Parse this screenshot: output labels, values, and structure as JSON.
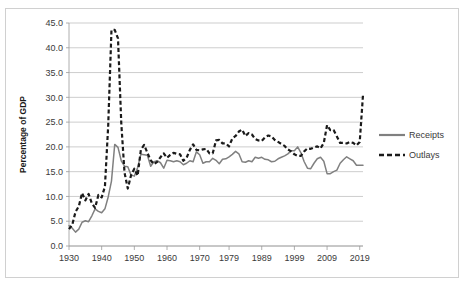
{
  "chart_data": {
    "type": "line",
    "title": "",
    "xlabel": "",
    "ylabel": "Percentage of GDP",
    "ylim": [
      0.0,
      45.0
    ],
    "xlim": [
      1930,
      2020
    ],
    "yticks": [
      "0.0",
      "5.0",
      "10.0",
      "15.0",
      "20.0",
      "25.0",
      "30.0",
      "35.0",
      "40.0",
      "45.0"
    ],
    "ytick_values": [
      0.0,
      5.0,
      10.0,
      15.0,
      20.0,
      25.0,
      30.0,
      35.0,
      40.0,
      45.0
    ],
    "xticks": [
      "1930",
      "1940",
      "1950",
      "1960",
      "1970",
      "1979",
      "1989",
      "1999",
      "2009",
      "2019"
    ],
    "xtick_values": [
      1930,
      1940,
      1950,
      1960,
      1970,
      1979,
      1989,
      1999,
      2009,
      2019
    ],
    "grid": true,
    "legend_position": "right",
    "x": [
      1930,
      1931,
      1932,
      1933,
      1934,
      1935,
      1936,
      1937,
      1938,
      1939,
      1940,
      1941,
      1942,
      1943,
      1944,
      1945,
      1946,
      1947,
      1948,
      1949,
      1950,
      1951,
      1952,
      1953,
      1954,
      1955,
      1956,
      1957,
      1958,
      1959,
      1960,
      1961,
      1962,
      1963,
      1964,
      1965,
      1966,
      1967,
      1968,
      1969,
      1970,
      1971,
      1972,
      1973,
      1974,
      1975,
      1976,
      1977,
      1978,
      1979,
      1980,
      1981,
      1982,
      1983,
      1984,
      1985,
      1986,
      1987,
      1988,
      1989,
      1990,
      1991,
      1992,
      1993,
      1994,
      1995,
      1996,
      1997,
      1998,
      1999,
      2000,
      2001,
      2002,
      2003,
      2004,
      2005,
      2006,
      2007,
      2008,
      2009,
      2010,
      2011,
      2012,
      2013,
      2014,
      2015,
      2016,
      2017,
      2018,
      2019,
      2020
    ],
    "series": [
      {
        "name": "Receipts",
        "style": "solid",
        "color": "#808080",
        "values": [
          4.1,
          3.6,
          2.8,
          3.4,
          4.8,
          5.1,
          4.9,
          6.1,
          7.5,
          7.0,
          6.7,
          7.5,
          9.9,
          13.1,
          20.5,
          19.9,
          17.2,
          16.1,
          16.0,
          14.3,
          14.1,
          15.8,
          18.5,
          18.4,
          18.3,
          16.1,
          17.0,
          17.2,
          16.8,
          15.7,
          17.3,
          17.2,
          17.0,
          17.2,
          17.0,
          16.4,
          16.7,
          17.2,
          17.0,
          19.0,
          18.4,
          16.7,
          17.0,
          17.0,
          17.7,
          17.3,
          16.6,
          17.5,
          17.6,
          18.0,
          18.5,
          19.1,
          18.6,
          17.0,
          16.9,
          17.2,
          17.0,
          17.9,
          17.7,
          17.9,
          17.5,
          17.4,
          17.0,
          17.1,
          17.6,
          17.9,
          18.2,
          18.6,
          19.2,
          19.2,
          20.0,
          18.8,
          17.0,
          15.7,
          15.6,
          16.7,
          17.6,
          17.9,
          17.1,
          14.6,
          14.6,
          15.0,
          15.3,
          16.7,
          17.4,
          18.0,
          17.6,
          17.2,
          16.3,
          16.3,
          16.3
        ]
      },
      {
        "name": "Outlays",
        "style": "dashed",
        "color": "#1a1a1a",
        "values": [
          3.4,
          4.3,
          6.9,
          8.0,
          10.7,
          9.2,
          10.5,
          8.6,
          7.7,
          10.3,
          9.8,
          12.0,
          24.3,
          43.6,
          43.6,
          41.9,
          24.8,
          14.8,
          11.6,
          14.3,
          15.6,
          14.2,
          19.4,
          20.4,
          18.8,
          17.3,
          16.5,
          17.0,
          17.9,
          18.7,
          17.8,
          18.4,
          18.8,
          18.6,
          18.5,
          17.2,
          17.8,
          19.4,
          20.5,
          19.4,
          19.3,
          19.5,
          19.6,
          18.7,
          18.7,
          21.3,
          21.4,
          20.7,
          20.7,
          20.1,
          21.7,
          22.2,
          23.1,
          23.5,
          22.2,
          22.8,
          22.5,
          21.6,
          21.3,
          21.2,
          21.9,
          22.3,
          22.1,
          21.4,
          21.0,
          20.6,
          20.2,
          19.5,
          19.1,
          18.5,
          18.2,
          18.2,
          19.1,
          19.7,
          19.6,
          19.9,
          20.1,
          19.7,
          20.8,
          24.4,
          23.4,
          23.4,
          22.1,
          20.8,
          20.8,
          20.7,
          21.0,
          20.8,
          20.3,
          21.0,
          30.5
        ]
      }
    ]
  },
  "legend": {
    "items": [
      {
        "label": "Receipts",
        "style": "solid",
        "color": "#808080"
      },
      {
        "label": "Outlays",
        "style": "dashed",
        "color": "#1a1a1a"
      }
    ]
  },
  "axes": {
    "y_title": "Percentage of GDP"
  }
}
